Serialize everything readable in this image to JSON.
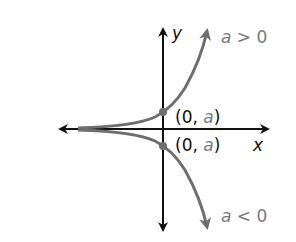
{
  "diagram": {
    "title": "",
    "axes": {
      "x_label": "x",
      "y_label": "y"
    },
    "curves": [
      {
        "name": "growth",
        "condition_label_var": "a",
        "condition_label_op": " > ",
        "condition_label_val": "0",
        "point_label_open": "(0, ",
        "point_label_var": "a",
        "point_label_close": ")",
        "color": "#6e6e6e"
      },
      {
        "name": "reflection",
        "condition_label_var": "a",
        "condition_label_op": " < ",
        "condition_label_val": "0",
        "point_label_open": "(0, ",
        "point_label_var": "a",
        "point_label_close": ")",
        "color": "#6e6e6e"
      }
    ],
    "colors": {
      "axis": "#111111",
      "curve": "#6e6e6e",
      "accent_text": "#7a7a7a"
    }
  }
}
